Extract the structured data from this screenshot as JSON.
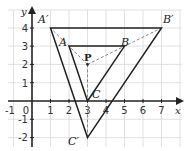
{
  "diagram": {
    "type": "coordinate-grid-enlargement",
    "axes": {
      "x_label": "x",
      "y_label": "y",
      "x_ticks": [
        "-1",
        "0",
        "1",
        "2",
        "3",
        "4",
        "5",
        "6",
        "7"
      ],
      "y_ticks": [
        "4",
        "3",
        "2",
        "1",
        "-1",
        "-2"
      ]
    },
    "points": {
      "A": {
        "label": "A",
        "x": 2,
        "y": 3
      },
      "B": {
        "label": "B",
        "x": 5,
        "y": 3
      },
      "C": {
        "label": "C",
        "x": 3,
        "y": 0
      },
      "A_prime": {
        "label": "A′",
        "x": 1,
        "y": 4
      },
      "B_prime": {
        "label": "B′",
        "x": 7,
        "y": 4
      },
      "C_prime": {
        "label": "C′",
        "x": 3,
        "y": -2
      },
      "P": {
        "label": "P",
        "x": 3,
        "y": 2
      }
    },
    "colors": {
      "grid": "#d9d9d9",
      "axis": "#222222",
      "shape": "#222222",
      "dashed": "#888888"
    }
  }
}
